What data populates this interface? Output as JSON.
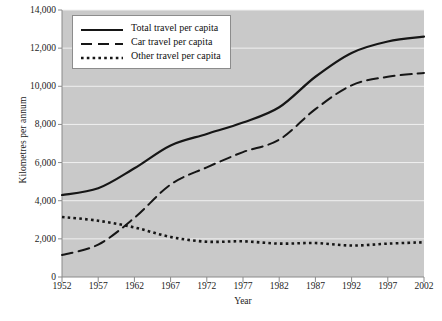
{
  "chart_data": {
    "type": "line",
    "title": "",
    "xlabel": "Year",
    "ylabel": "Kilometres per annum",
    "x": [
      1952,
      1957,
      1962,
      1967,
      1972,
      1977,
      1982,
      1987,
      1992,
      1997,
      2002
    ],
    "categories": [
      "1952",
      "1957",
      "1962",
      "1967",
      "1972",
      "1977",
      "1982",
      "1987",
      "1992",
      "1997",
      "2002"
    ],
    "xlim": [
      1952,
      2002
    ],
    "ylim": [
      0,
      14000
    ],
    "yticks": [
      0,
      2000,
      4000,
      6000,
      8000,
      10000,
      12000,
      14000
    ],
    "ytick_labels": [
      "0",
      "2,000",
      "4,000",
      "6,000",
      "8,000",
      "10,000",
      "12,000",
      "14,000"
    ],
    "grid": true,
    "grid_axis": "y",
    "legend_position": "top-left",
    "plot_background": "#c9c9c9",
    "grid_color": "#f0f0f0",
    "line_color": "#161616",
    "series": [
      {
        "name": "Total travel per capita",
        "style": "solid",
        "values": [
          4300,
          4650,
          5700,
          6900,
          7500,
          8100,
          8900,
          10500,
          11750,
          12350,
          12600
        ]
      },
      {
        "name": "Car travel per capita",
        "style": "dashed",
        "values": [
          1150,
          1700,
          3100,
          4850,
          5750,
          6550,
          7200,
          8800,
          10050,
          10500,
          10700
        ]
      },
      {
        "name": "Other travel per capita",
        "style": "dotted",
        "values": [
          3150,
          2950,
          2600,
          2100,
          1850,
          1870,
          1750,
          1780,
          1650,
          1750,
          1820
        ]
      }
    ]
  },
  "legend": {
    "items": [
      {
        "label": "Total travel per capita",
        "style": "solid"
      },
      {
        "label": "Car travel per capita",
        "style": "dashed"
      },
      {
        "label": "Other travel per capita",
        "style": "dotted"
      }
    ]
  }
}
